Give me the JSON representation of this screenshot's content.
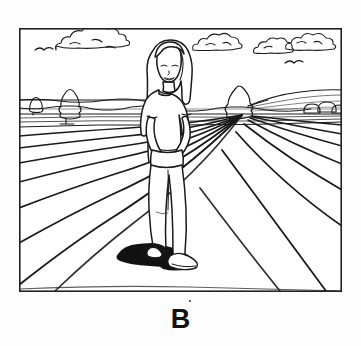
{
  "figure": {
    "label": "B",
    "caption_label": "B",
    "medium": "black-and-white line drawing",
    "frame": {
      "x": 19,
      "y": 28,
      "width": 323,
      "height": 264,
      "stroke_color": "#222222",
      "stroke_width": 1.6,
      "fill_color": "#ffffff"
    },
    "ink_color": "#1a1a1a",
    "shadow_color": "#111111",
    "page_background": "#fdfdfd"
  },
  "scene": {
    "title": "Woman standing in a plowed field",
    "setting": "open farmland with furrowed soil rows receding to the horizon",
    "horizon_y": 115,
    "vanishing_point": {
      "x": 252,
      "y": 113
    },
    "sky": {
      "name": "sky",
      "region_y_range": [
        28,
        115
      ],
      "clouds": [
        {
          "id": "cloud-left",
          "cx": 88,
          "cy": 42,
          "rx": 34,
          "ry": 11
        },
        {
          "id": "cloud-center-right",
          "cx": 216,
          "cy": 42,
          "rx": 24,
          "ry": 10
        },
        {
          "id": "cloud-right-a",
          "cx": 272,
          "cy": 45,
          "rx": 19,
          "ry": 9
        },
        {
          "id": "cloud-right-b",
          "cx": 308,
          "cy": 41,
          "rx": 24,
          "ry": 10
        }
      ],
      "birds": [
        {
          "id": "bird-upper-left",
          "x": 44,
          "y": 48
        },
        {
          "id": "bird-right",
          "x": 294,
          "y": 62
        }
      ]
    },
    "background": {
      "hills": [
        {
          "id": "hill-left",
          "from_x": 19,
          "to_x": 150,
          "crest_y": 100
        },
        {
          "id": "hill-right",
          "from_x": 250,
          "to_x": 342,
          "crest_y": 92
        }
      ],
      "trees": [
        {
          "id": "tree-tall-left",
          "x": 66,
          "y": 92,
          "height": 28,
          "type": "narrow-conifer"
        },
        {
          "id": "tree-small-left",
          "x": 33,
          "y": 99,
          "height": 14,
          "type": "small-shrub"
        },
        {
          "id": "tree-right",
          "x": 236,
          "y": 88,
          "height": 30,
          "type": "broad-bush"
        }
      ],
      "bushes": [
        {
          "id": "bush-right-a",
          "cx": 312,
          "cy": 110,
          "r": 8
        },
        {
          "id": "bush-right-b",
          "cx": 326,
          "cy": 108,
          "r": 9
        },
        {
          "id": "bush-right-c",
          "cx": 337,
          "cy": 111,
          "r": 7
        }
      ]
    },
    "field": {
      "name": "plowed field",
      "furrow_count": 12,
      "description": "parallel soil furrows in one-point perspective converging toward the vanishing point",
      "near_edge_y": 292
    },
    "figure_person": {
      "name": "woman",
      "pose": "standing, facing viewer, weight on one leg, hands clasped in front",
      "expression": "smiling",
      "hair": "long straight hair past the shoulders",
      "clothing_top": "short-sleeved t-shirt",
      "clothing_bottom": "long pants",
      "footwear": "shoes",
      "head": {
        "cx": 168,
        "cy": 66,
        "rx": 14,
        "ry": 18
      },
      "feet_y": 262,
      "shadow": {
        "id": "ground-shadow",
        "cx": 150,
        "cy": 256,
        "rx": 28,
        "ry": 9,
        "color": "#111111"
      }
    }
  }
}
